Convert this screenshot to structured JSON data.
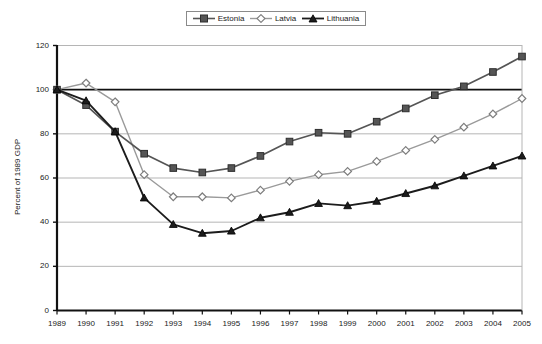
{
  "chart_data": {
    "type": "line",
    "title": "",
    "xlabel": "",
    "ylabel": "Percent of 1989 GDP",
    "ylim": [
      0,
      120
    ],
    "yticks": [
      0,
      20,
      40,
      60,
      80,
      100,
      120
    ],
    "grid": true,
    "legend_position": "top-center",
    "categories": [
      "1989",
      "1990",
      "1991",
      "1992",
      "1993",
      "1994",
      "1995",
      "1996",
      "1997",
      "1998",
      "1999",
      "2000",
      "2001",
      "2002",
      "2003",
      "2004",
      "2005"
    ],
    "x": [
      1989,
      1990,
      1991,
      1992,
      1993,
      1994,
      1995,
      1996,
      1997,
      1998,
      1999,
      2000,
      2001,
      2002,
      2003,
      2004,
      2005
    ],
    "series": [
      {
        "name": "Estonia",
        "marker": "square",
        "color": "#555555",
        "values": [
          100,
          93,
          81,
          71,
          64.5,
          62.5,
          64.5,
          70,
          76.5,
          80.5,
          80,
          85.5,
          91.5,
          97.5,
          101.5,
          108,
          115
        ]
      },
      {
        "name": "Latvia",
        "marker": "diamond",
        "color": "#9a9a9a",
        "values": [
          100,
          103,
          94.5,
          61.5,
          51.5,
          51.5,
          51,
          54.5,
          58.5,
          61.5,
          63,
          67.5,
          72.5,
          77.5,
          83,
          89,
          96
        ]
      },
      {
        "name": "Lithuania",
        "marker": "triangle",
        "color": "#1c1c1c",
        "values": [
          100,
          95,
          81,
          51,
          39,
          35,
          36,
          42,
          44.5,
          48.5,
          47.5,
          49.5,
          53,
          56.5,
          61,
          65.5,
          70
        ]
      }
    ]
  },
  "legend": {
    "items": [
      {
        "label": "Estonia"
      },
      {
        "label": "Latvia"
      },
      {
        "label": "Lithuania"
      }
    ]
  },
  "axes": {
    "y_title": "Percent of 1989 GDP",
    "y_tick_labels": [
      "120",
      "100",
      "80",
      "60",
      "40",
      "20",
      "0"
    ],
    "x_tick_labels": [
      "1989",
      "1990",
      "1991",
      "1992",
      "1993",
      "1994",
      "1995",
      "1996",
      "1997",
      "1998",
      "1999",
      "2000",
      "2001",
      "2002",
      "2003",
      "2004",
      "2005"
    ]
  },
  "colors": {
    "estonia": "#555555",
    "latvia": "#9a9a9a",
    "lithuania": "#1c1c1c",
    "gridline": "#b5b5b5",
    "axis": "#111111",
    "baseline_100": "#111111",
    "background": "#ffffff"
  }
}
